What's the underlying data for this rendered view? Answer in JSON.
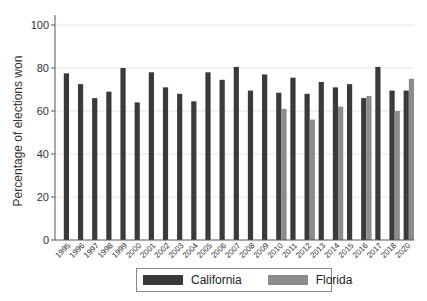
{
  "chart_data": {
    "type": "bar",
    "title": "",
    "xlabel": "",
    "ylabel": "Percentage of elections won",
    "ylim": [
      0,
      100
    ],
    "yticks": [
      0,
      20,
      40,
      60,
      80,
      100
    ],
    "grid": true,
    "legend_position": "bottom",
    "categories": [
      "1995",
      "1996",
      "1997",
      "1998",
      "1999",
      "2000",
      "2001",
      "2002",
      "2003",
      "2004",
      "2005",
      "2006",
      "2007",
      "2008",
      "2009",
      "2010",
      "2011",
      "2012",
      "2013",
      "2014",
      "2015",
      "2016",
      "2017",
      "2018",
      "2020"
    ],
    "series": [
      {
        "name": "California",
        "color": "#3a3a3a",
        "values": [
          77.5,
          72.5,
          66,
          69,
          80,
          64,
          78,
          71,
          68,
          64.5,
          78,
          74.5,
          80.5,
          69.5,
          77,
          68.5,
          75.5,
          68,
          73.5,
          71,
          72.5,
          66,
          80.5,
          69.5,
          69.5
        ]
      },
      {
        "name": "Florida",
        "color": "#8c8c8c",
        "values": [
          null,
          null,
          null,
          null,
          null,
          null,
          null,
          null,
          null,
          null,
          null,
          null,
          null,
          null,
          null,
          61,
          null,
          56,
          null,
          62,
          null,
          67,
          null,
          60,
          75
        ]
      }
    ]
  },
  "legend": {
    "items": [
      {
        "label": "California",
        "color": "#3a3a3a"
      },
      {
        "label": "Florida",
        "color": "#8c8c8c"
      }
    ]
  }
}
